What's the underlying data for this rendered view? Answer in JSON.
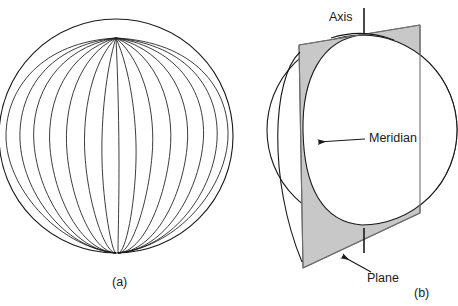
{
  "figure": {
    "background_color": "#ffffff",
    "line_color": "#1a1a1a",
    "plane_fill_color": "#c8c8c8",
    "plane_edge_color": "#6e6e6e",
    "text_color": "#1a1a1a"
  },
  "panel_a": {
    "caption": "(a)",
    "description": "Sphere drawn with meridian curves converging at the pole",
    "sphere": {
      "center_x": 116,
      "center_y": 136,
      "radius": 117,
      "pole_x": 116,
      "pole_y": 38,
      "meridian_count": 15
    }
  },
  "panel_b": {
    "caption": "(b)",
    "description": "Sphere cut by a plane through the axis producing a meridian",
    "labels": {
      "axis": "Axis",
      "meridian": "Meridian",
      "plane": "Plane"
    },
    "sphere": {
      "center_x": 362,
      "center_y": 130,
      "radius": 95
    },
    "axis_line": {
      "x": 364,
      "top_y": 8,
      "bottom_y": 253
    },
    "plane_corners": [
      [
        299,
        45
      ],
      [
        420,
        25
      ],
      [
        420,
        213
      ],
      [
        303,
        268
      ]
    ]
  }
}
